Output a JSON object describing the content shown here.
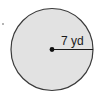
{
  "diagram": {
    "shape": "circle",
    "radius_label": "7 yd",
    "radius_value": 7,
    "radius_unit": "yd",
    "colors": {
      "fill": "#e2e2e2",
      "stroke": "#3a3a3a",
      "radius_line": "#1a1a1a",
      "center_dot": "#111111",
      "text": "#1a1a1a"
    }
  }
}
